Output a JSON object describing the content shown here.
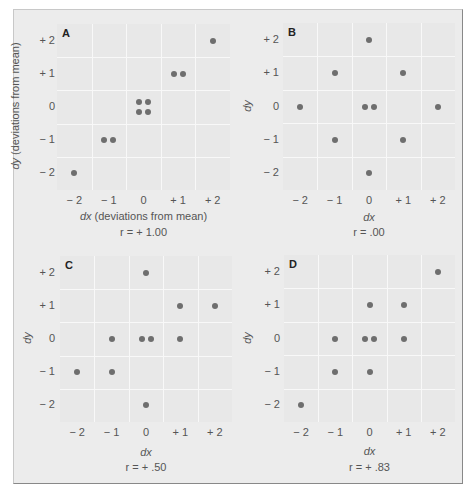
{
  "figure": {
    "panels": [
      {
        "id": "A",
        "xlabel_var": "dx",
        "xlabel_rest": " (deviations from mean)",
        "ylabel_var": "dy",
        "ylabel_rest": " (deviations from mean)",
        "r_label": "r = + 1.00"
      },
      {
        "id": "B",
        "xlabel_var": "dx",
        "xlabel_rest": "",
        "ylabel_var": "dy",
        "ylabel_rest": "",
        "r_label": "r = .00"
      },
      {
        "id": "C",
        "xlabel_var": "dx",
        "xlabel_rest": "",
        "ylabel_var": "dy",
        "ylabel_rest": "",
        "r_label": "r = + .50"
      },
      {
        "id": "D",
        "xlabel_var": "dx",
        "xlabel_rest": "",
        "ylabel_var": "dy",
        "ylabel_rest": "",
        "r_label": "r = + .83"
      }
    ],
    "x_ticks": [
      "− 2",
      "− 1",
      "0",
      "+ 1",
      "+ 2"
    ],
    "y_ticks": [
      "+ 2",
      "+ 1",
      "0",
      "− 1",
      "− 2"
    ],
    "colors": {
      "background": "#ececec",
      "plot_bg": "#e8e8e8",
      "grid": "#f8f8f8",
      "point": "#6e6e6e"
    }
  },
  "chart_data": [
    {
      "type": "scatter",
      "title": "A",
      "xlabel": "dx (deviations from mean)",
      "ylabel": "dy (deviations from mean)",
      "annotation": "r = + 1.00",
      "xlim": [
        -2.5,
        2.5
      ],
      "ylim": [
        -2.5,
        2.5
      ],
      "grid": true,
      "x_ticks": [
        -2,
        -1,
        0,
        1,
        2
      ],
      "y_ticks": [
        -2,
        -1,
        0,
        1,
        2
      ],
      "points": [
        [
          -2,
          -2
        ],
        [
          -1,
          -1
        ],
        [
          -1,
          -1
        ],
        [
          0,
          0
        ],
        [
          0,
          0
        ],
        [
          0,
          0
        ],
        [
          0,
          0
        ],
        [
          1,
          1
        ],
        [
          1,
          1
        ],
        [
          2,
          2
        ]
      ]
    },
    {
      "type": "scatter",
      "title": "B",
      "xlabel": "dx",
      "ylabel": "dy",
      "annotation": "r = .00",
      "xlim": [
        -2.5,
        2.5
      ],
      "ylim": [
        -2.5,
        2.5
      ],
      "grid": true,
      "x_ticks": [
        -2,
        -1,
        0,
        1,
        2
      ],
      "y_ticks": [
        -2,
        -1,
        0,
        1,
        2
      ],
      "points": [
        [
          0,
          2
        ],
        [
          -1,
          1
        ],
        [
          1,
          1
        ],
        [
          -2,
          0
        ],
        [
          0,
          0
        ],
        [
          0,
          0
        ],
        [
          2,
          0
        ],
        [
          -1,
          -1
        ],
        [
          1,
          -1
        ],
        [
          0,
          -2
        ]
      ]
    },
    {
      "type": "scatter",
      "title": "C",
      "xlabel": "dx",
      "ylabel": "dy",
      "annotation": "r = + .50",
      "xlim": [
        -2.5,
        2.5
      ],
      "ylim": [
        -2.5,
        2.5
      ],
      "grid": true,
      "x_ticks": [
        -2,
        -1,
        0,
        1,
        2
      ],
      "y_ticks": [
        -2,
        -1,
        0,
        1,
        2
      ],
      "points": [
        [
          0,
          2
        ],
        [
          1,
          1
        ],
        [
          2,
          1
        ],
        [
          -1,
          0
        ],
        [
          0,
          0
        ],
        [
          0,
          0
        ],
        [
          1,
          0
        ],
        [
          -2,
          -1
        ],
        [
          -1,
          -1
        ],
        [
          0,
          -2
        ]
      ]
    },
    {
      "type": "scatter",
      "title": "D",
      "xlabel": "dx",
      "ylabel": "dy",
      "annotation": "r = + .83",
      "xlim": [
        -2.5,
        2.5
      ],
      "ylim": [
        -2.5,
        2.5
      ],
      "grid": true,
      "x_ticks": [
        -2,
        -1,
        0,
        1,
        2
      ],
      "y_ticks": [
        -2,
        -1,
        0,
        1,
        2
      ],
      "points": [
        [
          2,
          2
        ],
        [
          0,
          1
        ],
        [
          1,
          1
        ],
        [
          -1,
          0
        ],
        [
          0,
          0
        ],
        [
          0,
          0
        ],
        [
          1,
          0
        ],
        [
          -1,
          -1
        ],
        [
          0,
          -1
        ],
        [
          -2,
          -2
        ]
      ]
    }
  ]
}
